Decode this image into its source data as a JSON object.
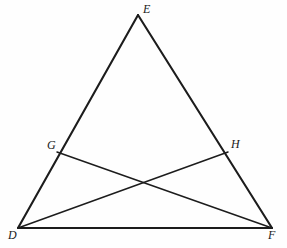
{
  "figure": {
    "background_color": "#fefefe",
    "stroke_color": "#1c1c1c",
    "width": 287,
    "height": 248,
    "vertices": [
      {
        "id": "E",
        "label": "E",
        "x": 138,
        "y": 15
      },
      {
        "id": "D",
        "label": "D",
        "x": 18,
        "y": 228
      },
      {
        "id": "F",
        "label": "F",
        "x": 272,
        "y": 228
      },
      {
        "id": "G",
        "label": "G",
        "x": 57,
        "y": 152
      },
      {
        "id": "H",
        "label": "H",
        "x": 228,
        "y": 152
      }
    ],
    "segments": [
      {
        "id": "DE",
        "from": "D",
        "to": "E",
        "weight": "thick"
      },
      {
        "id": "EF",
        "from": "E",
        "to": "F",
        "weight": "thick"
      },
      {
        "id": "DF",
        "from": "D",
        "to": "F",
        "weight": "medium"
      },
      {
        "id": "GF",
        "from": "G",
        "to": "F",
        "weight": "thin"
      },
      {
        "id": "DH",
        "from": "D",
        "to": "H",
        "weight": "thin"
      }
    ],
    "intersection": {
      "id": "GF-DH-crossing",
      "x": 140,
      "y": 178
    },
    "labels": {
      "E": "E",
      "D": "D",
      "F": "F",
      "G": "G",
      "H": "H"
    }
  }
}
